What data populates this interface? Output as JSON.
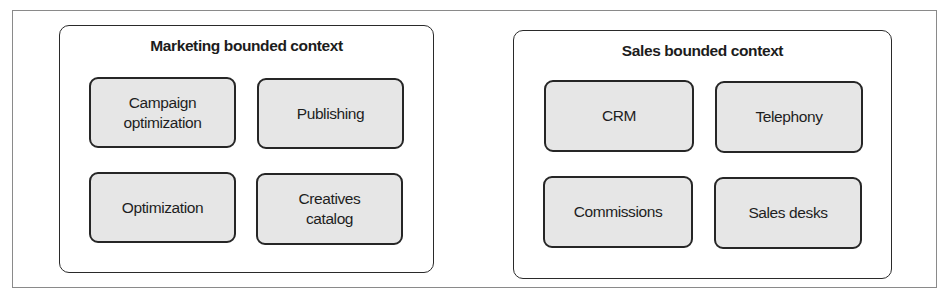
{
  "contexts": [
    {
      "title": "Marketing bounded context",
      "subdomains": [
        {
          "label": "Campaign optimization"
        },
        {
          "label": "Publishing"
        },
        {
          "label": "Optimization"
        },
        {
          "label": "Creatives catalog"
        }
      ]
    },
    {
      "title": "Sales bounded context",
      "subdomains": [
        {
          "label": "CRM"
        },
        {
          "label": "Telephony"
        },
        {
          "label": "Commissions"
        },
        {
          "label": "Sales desks"
        }
      ]
    }
  ],
  "colors": {
    "subdomain_fill": "#e6e6e6",
    "border": "#262626",
    "frame_border": "#8a8a8a",
    "background": "#ffffff"
  }
}
